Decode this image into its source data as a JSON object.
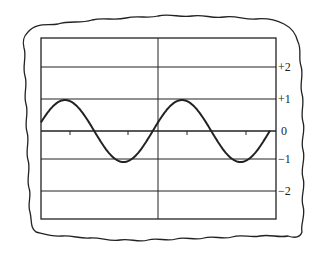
{
  "figure": {
    "type": "oscilloscope-screen",
    "y_labels": [
      {
        "text": "+2",
        "y": 67
      },
      {
        "text": "+1",
        "y": 99
      },
      {
        "text": "0",
        "y": 131
      },
      {
        "text": "−1",
        "y": 159
      },
      {
        "text": "−2",
        "y": 191
      }
    ],
    "colors": {
      "ink": "#222222",
      "background": "#ffffff"
    }
  },
  "chart_data": {
    "type": "line",
    "title": "",
    "xlabel": "",
    "ylabel": "",
    "ylim": [
      -3,
      3
    ],
    "yticks": [
      "+2",
      "+1",
      "0",
      "-1",
      "-2"
    ],
    "grid": true,
    "series": [
      {
        "name": "sine wave",
        "amplitude": 1,
        "cycles_shown": 2,
        "description": "sinusoid of amplitude 1 starting near +0.3, peaks at +1, troughs at -1, roughly two full periods across the screen"
      }
    ]
  }
}
